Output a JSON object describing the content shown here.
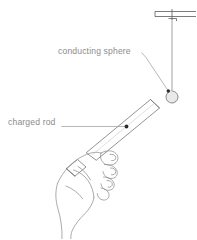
{
  "figure": {
    "background_color": "#ffffff",
    "line_color": "#6f6f6f",
    "text_color": "#8c8c8c",
    "labels": [
      {
        "id": "conducting-sphere",
        "text": "conducting sphere",
        "x": 58,
        "y": 54
      },
      {
        "id": "charged-rod",
        "text": "charged rod",
        "x": 8,
        "y": 125
      }
    ],
    "elements": {
      "support_bar": "horizontal ceiling support bar with clamp",
      "thread": "vertical suspension thread",
      "sphere": {
        "name": "conducting sphere",
        "center_x": 172,
        "center_y": 97,
        "radius": 6,
        "fill_color": "#e8e8e8"
      },
      "rod": "charged rod held at an angle",
      "hand": "hand gripping the charged rod"
    }
  }
}
